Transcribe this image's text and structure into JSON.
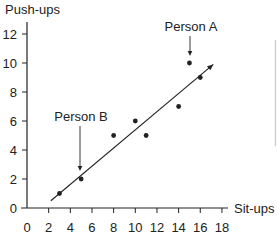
{
  "chart_data": {
    "type": "scatter",
    "title": "",
    "xlabel": "Sit-ups",
    "ylabel": "Push-ups",
    "xlim": [
      0,
      18
    ],
    "ylim": [
      0,
      13
    ],
    "xticks": [
      0,
      2,
      4,
      6,
      8,
      10,
      12,
      14,
      16,
      18
    ],
    "yticks": [
      0,
      2,
      4,
      6,
      8,
      10,
      12
    ],
    "grid": false,
    "legend": null,
    "series": [
      {
        "name": "data",
        "points": [
          {
            "x": 3,
            "y": 1
          },
          {
            "x": 5,
            "y": 2
          },
          {
            "x": 8,
            "y": 5
          },
          {
            "x": 10,
            "y": 6
          },
          {
            "x": 11,
            "y": 5
          },
          {
            "x": 14,
            "y": 7
          },
          {
            "x": 15,
            "y": 10
          },
          {
            "x": 16,
            "y": 9
          }
        ]
      }
    ],
    "trend_line": {
      "x1": 2.2,
      "y1": 0.5,
      "x2": 17.2,
      "y2": 9.9,
      "arrow_end": true
    },
    "annotations": [
      {
        "text": "Person A",
        "point": {
          "x": 15,
          "y": 10
        }
      },
      {
        "text": "Person B",
        "point": {
          "x": 5,
          "y": 2
        }
      }
    ]
  },
  "colors": {
    "ink": "#222222",
    "side_rule": "#cfcfcf"
  }
}
